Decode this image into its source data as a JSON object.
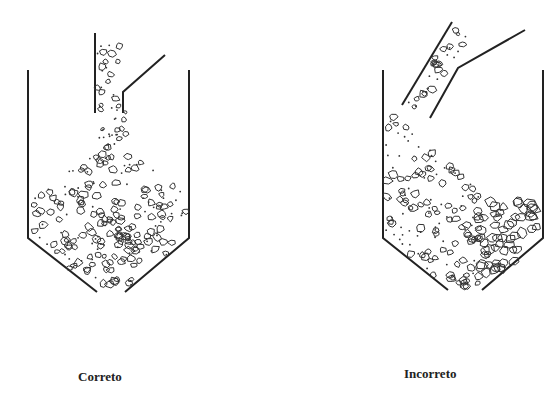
{
  "figure": {
    "panels": [
      {
        "id": "correct",
        "label": "Correto",
        "description": "Vertical chute feeding concrete/aggregate centrally into hopper; material forms uniform mixed pile"
      },
      {
        "id": "incorrect",
        "label": "Incorreto",
        "description": "Inclined chute feeding material against one wall; coarse aggregate segregates to opposite side"
      }
    ]
  }
}
